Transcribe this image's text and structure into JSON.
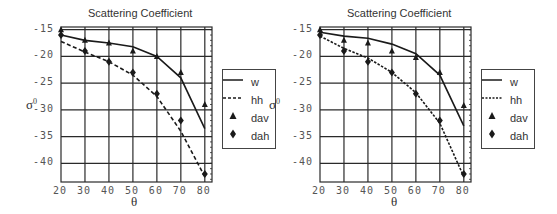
{
  "chart_data": [
    {
      "type": "line",
      "title": "Scattering Coefficient",
      "xlabel": "θ",
      "ylabel": "σ0",
      "x": [
        20,
        30,
        40,
        50,
        60,
        70,
        80
      ],
      "xticks": [
        "20",
        "30",
        "40",
        "50",
        "60",
        "70",
        "80"
      ],
      "yticks": [
        "-15",
        "-20",
        "-25",
        "-30",
        "-35",
        "-40"
      ],
      "xlim": [
        20,
        83
      ],
      "ylim": [
        -43.5,
        -14.5
      ],
      "grid": true,
      "legend_position": "right",
      "series": [
        {
          "name": "w",
          "style": "solid-line",
          "values": [
            -16,
            -17,
            -17.5,
            -18.2,
            -20,
            -24,
            -33.5
          ]
        },
        {
          "name": "hh",
          "style": "dashed-line",
          "values": [
            -17.2,
            -19.2,
            -21,
            -23.5,
            -27.5,
            -34,
            -42.5
          ]
        },
        {
          "name": "dav",
          "style": "triangle-marker",
          "values": [
            -15,
            -17,
            -17.5,
            -19,
            -20,
            -23,
            -29
          ]
        },
        {
          "name": "dah",
          "style": "diamond-marker",
          "values": [
            -16,
            -19,
            -21,
            -23,
            -27,
            -32,
            -42
          ]
        }
      ]
    },
    {
      "type": "line",
      "title": "Scattering Coefficient",
      "xlabel": "θ",
      "ylabel": "σ0",
      "x": [
        20,
        30,
        40,
        50,
        60,
        70,
        80
      ],
      "xticks": [
        "20",
        "30",
        "40",
        "50",
        "60",
        "70",
        "80"
      ],
      "yticks": [
        "-15",
        "-20",
        "-25",
        "-30",
        "-35",
        "-40"
      ],
      "xlim": [
        20,
        83
      ],
      "ylim": [
        -43.5,
        -14.5
      ],
      "grid": true,
      "legend_position": "right",
      "series": [
        {
          "name": "w",
          "style": "solid-line",
          "values": [
            -15.5,
            -16.2,
            -16.6,
            -17.7,
            -19.5,
            -23.5,
            -33
          ]
        },
        {
          "name": "hh",
          "style": "dashed-line",
          "values": [
            -16.2,
            -18.5,
            -20.3,
            -23,
            -26.8,
            -32.5,
            -42.5
          ]
        },
        {
          "name": "dav",
          "style": "triangle-marker",
          "values": [
            -15,
            -17,
            -17.5,
            -19,
            -20.2,
            -23,
            -29.2
          ]
        },
        {
          "name": "dah",
          "style": "diamond-marker",
          "values": [
            -16,
            -19,
            -21,
            -23,
            -27,
            -32,
            -42
          ]
        }
      ]
    }
  ],
  "panels": [
    {
      "title": "Scattering Coefficient",
      "xlabel": "θ",
      "ylabel_base": "σ",
      "ylabel_sup": "0",
      "legend": [
        {
          "label": "w"
        },
        {
          "label": "hh"
        },
        {
          "label": "dav"
        },
        {
          "label": "dah"
        }
      ]
    },
    {
      "title": "Scattering Coefficient",
      "xlabel": "θ",
      "ylabel_base": "σ",
      "ylabel_sup": "0",
      "legend": [
        {
          "label": "w"
        },
        {
          "label": "hh"
        },
        {
          "label": "dav"
        },
        {
          "label": "dah"
        }
      ]
    }
  ],
  "colors": {
    "line": "#1a1a1a",
    "grid": "#2a2a2a",
    "text": "#444444",
    "background": "#ffffff"
  }
}
